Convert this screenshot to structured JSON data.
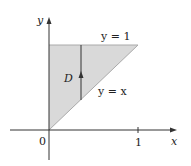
{
  "diagram": {
    "axes": {
      "x_label": "x",
      "y_label": "y",
      "origin_label": "0",
      "x_tick_label": "1"
    },
    "region": {
      "label": "D",
      "fill_color": "#d9d9d9",
      "vertices": [
        [
          0,
          0
        ],
        [
          0,
          1
        ],
        [
          1,
          1
        ]
      ]
    },
    "curves": {
      "top": "y = 1",
      "diagonal": "y = x"
    },
    "colors": {
      "axis": "#333333",
      "edge": "#333333"
    }
  }
}
